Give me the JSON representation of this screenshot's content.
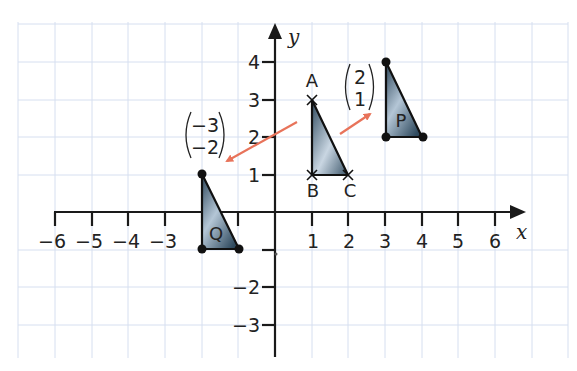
{
  "diagram": {
    "type": "coordinate-grid-translation",
    "axes": {
      "x_label": "x",
      "y_label": "y",
      "x_ticks": [
        {
          "value": -6,
          "label": "−6"
        },
        {
          "value": -5,
          "label": "−5"
        },
        {
          "value": -4,
          "label": "−4"
        },
        {
          "value": -3,
          "label": "−3"
        },
        {
          "value": -1,
          "label": ""
        },
        {
          "value": 1,
          "label": "1"
        },
        {
          "value": 2,
          "label": "2"
        },
        {
          "value": 3,
          "label": "3"
        },
        {
          "value": 4,
          "label": "4"
        },
        {
          "value": 5,
          "label": "5"
        },
        {
          "value": 6,
          "label": "6"
        }
      ],
      "y_ticks": [
        {
          "value": 4,
          "label": "4"
        },
        {
          "value": 3,
          "label": "3"
        },
        {
          "value": 2,
          "label": "2"
        },
        {
          "value": 1,
          "label": "1"
        },
        {
          "value": -1,
          "label": ""
        },
        {
          "value": -2,
          "label": "−2"
        },
        {
          "value": -3,
          "label": "−3"
        }
      ]
    },
    "shapes": {
      "ABC": {
        "vertices": [
          {
            "name": "A",
            "label": "A",
            "x": 1,
            "y": 3
          },
          {
            "name": "B",
            "label": "B",
            "x": 1,
            "y": 1
          },
          {
            "name": "C",
            "label": "C",
            "x": 2,
            "y": 1
          }
        ],
        "marker": "cross"
      },
      "P": {
        "label": "P",
        "vertices": [
          {
            "x": 3,
            "y": 4
          },
          {
            "x": 3,
            "y": 2
          },
          {
            "x": 4,
            "y": 2
          }
        ],
        "marker": "dot"
      },
      "Q": {
        "label": "Q",
        "vertices": [
          {
            "x": -2,
            "y": 1
          },
          {
            "x": -2,
            "y": -1
          },
          {
            "x": -1,
            "y": -1
          }
        ],
        "marker": "dot"
      }
    },
    "vectors": {
      "to_P": {
        "top": "2",
        "bottom": "1"
      },
      "to_Q": {
        "top": "−3",
        "bottom": "−2"
      }
    },
    "colors": {
      "grid": "#d6dff0",
      "axis": "#1a1a1a",
      "triangle_dark": "#3a5468",
      "triangle_light": "#dde6ee",
      "arrow": "#e8735a"
    }
  }
}
